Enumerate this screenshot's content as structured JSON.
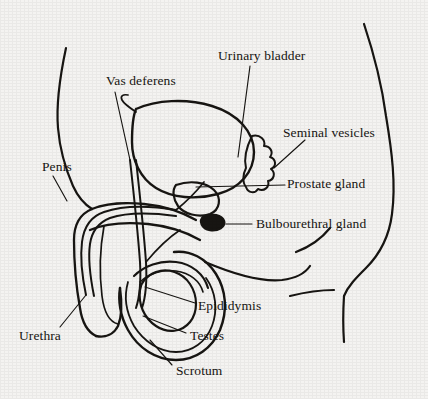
{
  "figure": {
    "background_color": "#f4f3f1",
    "ink_color": "#171512",
    "width": 428,
    "height": 399
  },
  "labels": [
    {
      "id": "urinary-bladder",
      "text": "Urinary bladder",
      "x": 218,
      "y": 49
    },
    {
      "id": "vas-deferens",
      "text": "Vas deferens",
      "x": 106,
      "y": 74
    },
    {
      "id": "seminal-vesicles",
      "text": "Seminal vesicles",
      "x": 283,
      "y": 126
    },
    {
      "id": "penis",
      "text": "Penis",
      "x": 42,
      "y": 160
    },
    {
      "id": "prostate-gland",
      "text": "Prostate gland",
      "x": 287,
      "y": 177
    },
    {
      "id": "bulbourethral-gland",
      "text": "Bulbourethral gland",
      "x": 256,
      "y": 217
    },
    {
      "id": "epididymis",
      "text": "Epididymis",
      "x": 198,
      "y": 299
    },
    {
      "id": "testes",
      "text": "Testes",
      "x": 190,
      "y": 329
    },
    {
      "id": "urethra",
      "text": "Urethra",
      "x": 19,
      "y": 329
    },
    {
      "id": "scrotum",
      "text": "Scrotum",
      "x": 176,
      "y": 364
    }
  ],
  "leader_lines": [
    {
      "id": "leader-urinary-bladder",
      "d": "M250,66 L238,157"
    },
    {
      "id": "leader-vas-deferens",
      "d": "M115,92 L130,160"
    },
    {
      "id": "leader-seminal-vesicles",
      "d": "M305,140 L274,168"
    },
    {
      "id": "leader-penis",
      "d": "M53,176 L67,201"
    },
    {
      "id": "leader-prostate-gland",
      "d": "M285,185 L196,187"
    },
    {
      "id": "leader-bulbourethral-gland",
      "d": "M252,224 L226,224"
    },
    {
      "id": "leader-epididymis",
      "d": "M195,303 L145,287"
    },
    {
      "id": "leader-testes",
      "d": "M186,333 L143,316"
    },
    {
      "id": "leader-urethra",
      "d": "M60,327 L86,295"
    },
    {
      "id": "leader-scrotum",
      "d": "M172,365 L150,340"
    }
  ],
  "shapes": {
    "body_outline_left": "M66,48 C60,76 56,104 58,128 C60,152 66,170 73,186 C78,197 84,204 92,209",
    "body_outline_right": "M364,24 C374,54 382,86 386,116 C392,152 396,184 392,214 C389,238 378,256 366,268 C356,278 348,286 344,296",
    "buttock_crease": "M205,262 C238,276 262,282 282,280 C298,278 306,272 310,266",
    "thigh_line_upper": "M296,252 C312,246 322,238 330,228",
    "thigh_line_lower": "M290,296 C306,292 320,290 334,290",
    "thigh_vertical": "M344,296 C343,312 343,328 344,342",
    "bladder": "M136,109 C156,100 186,98 212,106 C238,114 254,132 254,152 C254,172 240,188 218,194 C196,200 172,198 156,188 C140,178 132,160 132,142 C132,128 133,116 136,109",
    "bladder_top_notch": "M136,112 C130,108 124,104 122,100 C120,96 123,94 128,95",
    "prostate": "M176,185 C190,180 206,182 214,190 C222,198 220,210 210,214 C198,218 184,214 178,206 C173,199 172,190 176,185",
    "seminal_vesicles": "M252,136 C260,134 266,140 264,146 C270,146 274,152 270,157 C276,159 277,166 271,169 C276,173 274,180 268,181 C270,187 264,192 258,189 C255,194 248,193 246,187 C242,182 243,174 246,168 C244,160 246,148 252,136",
    "bulbourethral": "M204,216 C212,213 222,215 224,221 C226,227 218,231 210,230 C202,229 198,221 204,216",
    "vas_deferens_duct": "M130,160 C134,196 138,234 140,262 C141,280 140,296 136,308",
    "vas_deferens_duct2": "M136,160 C140,196 144,234 146,262 C147,280 146,296 142,308",
    "urethra_path": "M86,295 C82,276 80,258 82,242 C84,226 92,216 104,212 C124,205 152,206 176,210",
    "urethra_path2": "M94,296 C90,276 88,258 90,244 C92,230 100,222 110,218 C128,212 154,213 176,216",
    "penis_shaft_top": "M92,209 C104,204 124,202 144,204 C164,206 182,212 196,220",
    "penis_shaft_bot": "M90,230 C104,224 126,222 148,224 C168,226 186,232 200,240",
    "penis_tip_left": "M92,209 C80,214 74,224 74,240 C74,262 76,286 80,308 C82,322 88,332 96,336",
    "penis_glans": "M96,336 C106,338 114,334 118,326 C122,316 122,302 120,288",
    "corpus_line": "M104,226 C100,248 99,272 102,296 C104,312 110,322 118,324",
    "scrotum_outer": "M120,288 C118,300 120,316 128,330 C138,348 156,360 176,360 C196,360 212,348 220,330 C228,310 226,290 216,274 C206,258 190,250 174,252",
    "scrotum_inner": "M128,282 C124,296 126,312 134,326 C144,342 160,352 176,352 C192,352 206,342 212,326 C218,310 216,292 206,278",
    "testis": "M140,290 C138,304 144,318 156,326 C168,334 182,332 190,322 C198,312 198,296 190,284 C182,272 168,268 156,272 C146,276 141,282 140,290",
    "epididymis_arc": "M134,276 C144,266 160,260 176,262 C192,264 204,274 208,288",
    "epididymis_arc2": "M140,282 C148,274 162,269 176,271 C190,273 200,281 203,292",
    "ejaculatory_duct": "M176,210 C186,202 196,192 204,182",
    "duct_to_prostate": "M146,262 C156,250 168,238 180,230"
  }
}
